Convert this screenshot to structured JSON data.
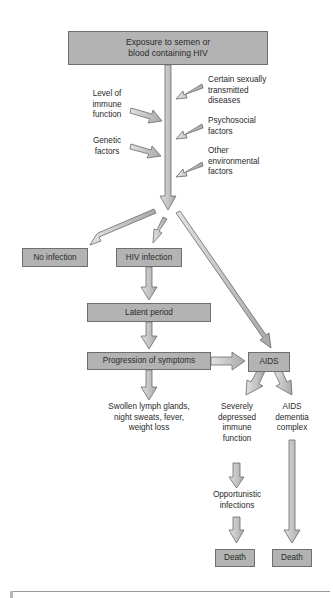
{
  "diagram": {
    "type": "flowchart",
    "title_box": {
      "line1": "Exposure to semen or",
      "line2": "blood containing HIV"
    },
    "modifiers_left": [
      {
        "text": "Level of\nimmune\nfunction"
      },
      {
        "text": "Genetic\nfactors"
      }
    ],
    "modifiers_right": [
      {
        "text": "Certain sexually\ntransmitted\ndiseases"
      },
      {
        "text": "Psychosocial\nfactors"
      },
      {
        "text": "Other\nenvironmental\nfactors"
      }
    ],
    "nodes": {
      "no_infection": "No infection",
      "hiv_infection": "HIV infection",
      "latent_period": "Latent period",
      "progression": "Progression of symptoms",
      "aids": "AIDS",
      "symptoms": "Swollen lymph glands,\nnight sweats, fever,\nweight loss",
      "depressed_immune": "Severely\ndepressed\nimmune\nfunction",
      "dementia": "AIDS\ndementia\ncomplex",
      "opportunistic": "Opportunistic\ninfections",
      "death_left": "Death",
      "death_right": "Death"
    },
    "colors": {
      "box_fill": "#b3b3b3",
      "box_border": "#6f6f6f",
      "arrow_fill": "#c4c4c4",
      "arrow_stroke": "#6a6a6a"
    }
  }
}
